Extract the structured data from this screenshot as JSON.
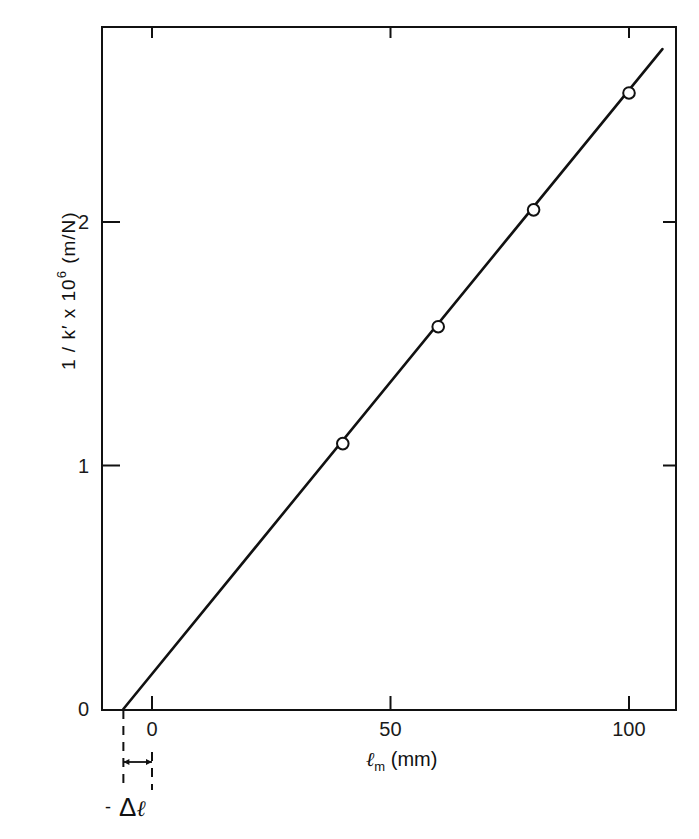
{
  "chart_data": {
    "type": "scatter",
    "title": "",
    "xlabel": "ℓm (mm)",
    "ylabel": "1 / k′ x 10^6 (m/N)",
    "xlim": [
      -10,
      110
    ],
    "ylim": [
      0,
      2.8
    ],
    "xticks": [
      0,
      50,
      100
    ],
    "yticks": [
      0,
      1,
      2
    ],
    "grid": false,
    "legend": null,
    "series": [
      {
        "name": "measured",
        "marker": "open-circle",
        "x": [
          40,
          60,
          80,
          100
        ],
        "y": [
          1.09,
          1.57,
          2.05,
          2.53
        ]
      },
      {
        "name": "linear fit",
        "style": "solid-line",
        "x": [
          -6,
          107
        ],
        "y": [
          0,
          2.71
        ]
      }
    ],
    "annotations": [
      {
        "text": "- Δℓ",
        "meaning": "x-intercept offset between line intercept and 0",
        "x_from": -6,
        "x_to": 0
      }
    ]
  },
  "labels": {
    "x_ticks": [
      "0",
      "50",
      "100"
    ],
    "y_ticks": [
      "0",
      "1",
      "2"
    ],
    "x_title_main": "ℓ",
    "x_title_sub": "m",
    "x_title_unit": " (mm)",
    "y_title_main": "1 / k′ x 10",
    "y_title_sup": "6",
    "y_title_unit": "  (m/N)",
    "delta_dash": "-",
    "delta_symbol": "Δ",
    "delta_ell": "ℓ"
  },
  "colors": {
    "ink": "#111111",
    "background": "#ffffff"
  }
}
